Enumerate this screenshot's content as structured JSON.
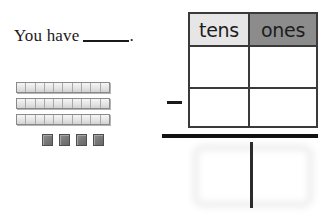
{
  "worksheet": {
    "prompt": {
      "lead_text": "You have",
      "blank": "",
      "trailing_text": "."
    },
    "manipulatives": {
      "tens_rods": {
        "count": 3,
        "segments_per_rod": 10,
        "label": "ten-rod"
      },
      "unit_cubes": {
        "count": 4,
        "label": "unit-cube"
      }
    },
    "place_value_table": {
      "headers": [
        "tens",
        "ones"
      ],
      "rows": [
        {
          "tens": "",
          "ones": ""
        },
        {
          "tens": "",
          "ones": ""
        }
      ],
      "operator": "–",
      "header_colors": {
        "tens_background": "#e6e6e6",
        "ones_background": "#8c8c8c"
      }
    },
    "answer": {
      "tens": "",
      "ones": ""
    }
  }
}
